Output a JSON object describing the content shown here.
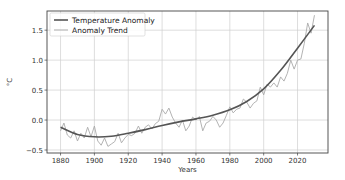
{
  "chart_data": {
    "type": "line",
    "title": "",
    "xlabel": "Years",
    "ylabel": "°C",
    "xlim": [
      1872,
      2038
    ],
    "ylim": [
      -0.55,
      1.82
    ],
    "grid": true,
    "legend_position": "upper left",
    "xticks": [
      1880,
      1900,
      1920,
      1940,
      1960,
      1980,
      2000,
      2020
    ],
    "xtick_labels": [
      "1880",
      "1900",
      "1920",
      "1940",
      "1960",
      "1980",
      "2000",
      "2020"
    ],
    "yticks": [
      -0.5,
      0.0,
      0.5,
      1.0,
      1.5
    ],
    "ytick_labels": [
      "−0.5",
      "0.0",
      "0.5",
      "1.0",
      "1.5"
    ],
    "legend": [
      "Temperature Anomaly",
      "Anomaly Trend"
    ],
    "series": [
      {
        "name": "Temperature Anomaly",
        "style": "smooth",
        "color": "#555555",
        "x": [
          1880,
          1890,
          1900,
          1910,
          1920,
          1930,
          1940,
          1950,
          1960,
          1970,
          1980,
          1990,
          2000,
          2010,
          2020,
          2030
        ],
        "values": [
          -0.12,
          -0.24,
          -0.28,
          -0.27,
          -0.22,
          -0.16,
          -0.09,
          -0.03,
          0.02,
          0.08,
          0.17,
          0.31,
          0.52,
          0.83,
          1.2,
          1.58
        ]
      },
      {
        "name": "Anomaly Trend",
        "style": "noisy",
        "color": "#aaaaaa",
        "x": [
          1880,
          1882,
          1884,
          1886,
          1888,
          1890,
          1892,
          1894,
          1896,
          1898,
          1900,
          1902,
          1904,
          1906,
          1908,
          1910,
          1912,
          1914,
          1916,
          1918,
          1920,
          1922,
          1924,
          1926,
          1928,
          1930,
          1932,
          1934,
          1936,
          1938,
          1940,
          1942,
          1944,
          1946,
          1948,
          1950,
          1952,
          1954,
          1956,
          1958,
          1960,
          1962,
          1964,
          1966,
          1968,
          1970,
          1972,
          1974,
          1976,
          1978,
          1980,
          1982,
          1984,
          1986,
          1988,
          1990,
          1992,
          1994,
          1996,
          1998,
          2000,
          2002,
          2004,
          2006,
          2008,
          2010,
          2012,
          2014,
          2016,
          2018,
          2020,
          2022,
          2024,
          2026,
          2028,
          2030
        ],
        "values": [
          -0.18,
          -0.05,
          -0.25,
          -0.3,
          -0.18,
          -0.35,
          -0.22,
          -0.3,
          -0.12,
          -0.28,
          -0.1,
          -0.35,
          -0.42,
          -0.3,
          -0.44,
          -0.4,
          -0.36,
          -0.22,
          -0.38,
          -0.3,
          -0.24,
          -0.26,
          -0.22,
          -0.1,
          -0.22,
          -0.12,
          -0.08,
          -0.15,
          -0.06,
          -0.02,
          0.18,
          0.1,
          0.2,
          0.05,
          -0.05,
          -0.12,
          0.0,
          -0.18,
          -0.1,
          0.05,
          0.0,
          0.06,
          -0.18,
          -0.05,
          -0.02,
          0.06,
          0.0,
          -0.12,
          -0.05,
          0.08,
          0.22,
          0.12,
          0.18,
          0.2,
          0.35,
          0.3,
          0.2,
          0.28,
          0.32,
          0.55,
          0.42,
          0.6,
          0.55,
          0.62,
          0.55,
          0.72,
          0.65,
          0.78,
          1.0,
          0.85,
          1.0,
          1.02,
          1.28,
          1.62,
          1.45,
          1.75
        ]
      }
    ]
  },
  "plot_box": {
    "left": 47,
    "top": 11,
    "right": 328,
    "bottom": 153
  },
  "axes": {
    "xlabel": "Years",
    "ylabel": "°C"
  },
  "legend": {
    "items": [
      {
        "label": "Temperature Anomaly",
        "color": "#555555",
        "width": 1.6
      },
      {
        "label": "Anomaly Trend",
        "color": "#aaaaaa",
        "width": 1.0
      }
    ]
  },
  "colors": {
    "frame": "#444444",
    "grid": "#d0d0d0"
  }
}
